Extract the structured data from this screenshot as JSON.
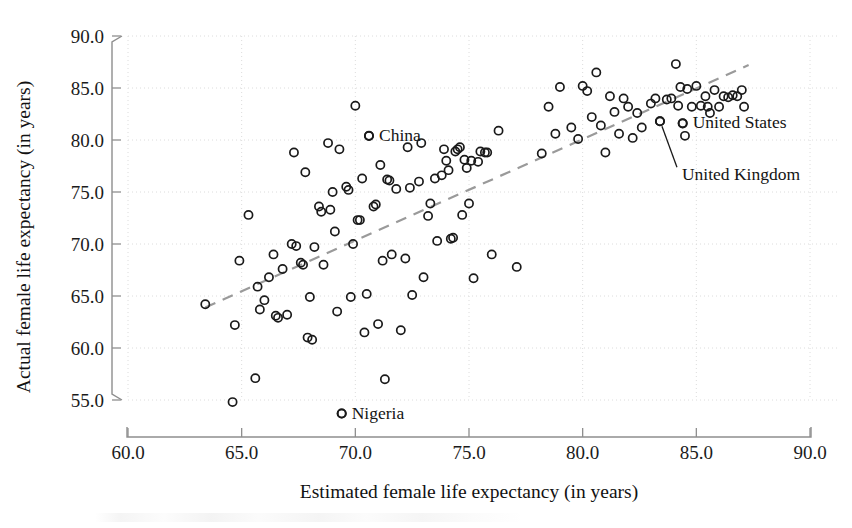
{
  "chart_data": {
    "type": "scatter",
    "title": "",
    "xlabel": "Estimated female life expectancy (in years)",
    "ylabel": "Actual female life expectancy (in years)",
    "xlim": [
      60.0,
      90.0
    ],
    "ylim": [
      55.0,
      90.0
    ],
    "xticks": [
      "60.0",
      "65.0",
      "70.0",
      "75.0",
      "80.0",
      "85.0",
      "90.0"
    ],
    "yticks": [
      "55.0",
      "60.0",
      "65.0",
      "70.0",
      "75.0",
      "80.0",
      "85.0",
      "90.0"
    ],
    "grid": true,
    "grid_style": "dotted",
    "legend": "none",
    "marker": "open-circle",
    "marker_color": "#1a1a1a",
    "trendline": {
      "style": "dashed",
      "color": "#9a9a9a",
      "x_start": 63.4,
      "y_start": 63.9,
      "x_end": 87.3,
      "y_end": 87.2
    },
    "annotations": [
      {
        "label": "China",
        "x": 70.6,
        "y": 80.4,
        "text_dx": 10,
        "text_dy": 5,
        "leader": false
      },
      {
        "label": "Nigeria",
        "x": 69.4,
        "y": 53.7,
        "text_dx": 10,
        "text_dy": 5,
        "leader": false
      },
      {
        "label": "United States",
        "x": 84.4,
        "y": 81.6,
        "text_dx": 10,
        "text_dy": 5,
        "leader": false
      },
      {
        "label": "United Kingdom",
        "x": 83.4,
        "y": 81.8,
        "text_dx": 10,
        "text_dy": 5,
        "leader": true
      }
    ],
    "points": [
      [
        63.4,
        64.2
      ],
      [
        64.6,
        54.8
      ],
      [
        64.7,
        62.2
      ],
      [
        64.9,
        68.4
      ],
      [
        65.3,
        72.8
      ],
      [
        65.6,
        57.1
      ],
      [
        65.7,
        65.9
      ],
      [
        65.8,
        63.7
      ],
      [
        66.0,
        64.6
      ],
      [
        66.2,
        66.8
      ],
      [
        66.4,
        69.0
      ],
      [
        66.5,
        63.1
      ],
      [
        66.6,
        62.9
      ],
      [
        66.8,
        67.6
      ],
      [
        67.0,
        63.2
      ],
      [
        67.2,
        70.0
      ],
      [
        67.3,
        78.8
      ],
      [
        67.4,
        69.8
      ],
      [
        67.6,
        68.2
      ],
      [
        67.7,
        68.0
      ],
      [
        67.8,
        76.9
      ],
      [
        67.9,
        61.0
      ],
      [
        68.0,
        64.9
      ],
      [
        68.1,
        60.8
      ],
      [
        68.2,
        69.7
      ],
      [
        68.4,
        73.6
      ],
      [
        68.5,
        73.1
      ],
      [
        68.6,
        68.0
      ],
      [
        68.8,
        79.7
      ],
      [
        68.9,
        73.3
      ],
      [
        69.0,
        75.0
      ],
      [
        69.1,
        71.2
      ],
      [
        69.2,
        63.5
      ],
      [
        69.3,
        79.1
      ],
      [
        69.4,
        53.7
      ],
      [
        69.6,
        75.5
      ],
      [
        69.7,
        75.2
      ],
      [
        69.8,
        64.9
      ],
      [
        69.9,
        70.0
      ],
      [
        70.0,
        83.3
      ],
      [
        70.1,
        72.3
      ],
      [
        70.2,
        72.3
      ],
      [
        70.3,
        76.3
      ],
      [
        70.4,
        61.5
      ],
      [
        70.5,
        65.2
      ],
      [
        70.6,
        80.4
      ],
      [
        70.8,
        73.6
      ],
      [
        70.9,
        73.8
      ],
      [
        71.0,
        62.3
      ],
      [
        71.1,
        77.6
      ],
      [
        71.2,
        68.4
      ],
      [
        71.3,
        57.0
      ],
      [
        71.4,
        76.2
      ],
      [
        71.5,
        76.1
      ],
      [
        71.6,
        69.0
      ],
      [
        71.8,
        75.3
      ],
      [
        72.0,
        61.7
      ],
      [
        72.2,
        68.6
      ],
      [
        72.3,
        79.3
      ],
      [
        72.4,
        75.4
      ],
      [
        72.5,
        65.1
      ],
      [
        72.8,
        76.0
      ],
      [
        72.9,
        79.7
      ],
      [
        73.0,
        66.8
      ],
      [
        73.2,
        72.7
      ],
      [
        73.3,
        73.9
      ],
      [
        73.5,
        76.3
      ],
      [
        73.6,
        70.3
      ],
      [
        73.8,
        76.6
      ],
      [
        73.9,
        79.1
      ],
      [
        74.0,
        78.0
      ],
      [
        74.1,
        77.1
      ],
      [
        74.2,
        70.5
      ],
      [
        74.3,
        70.6
      ],
      [
        74.4,
        78.9
      ],
      [
        74.5,
        79.1
      ],
      [
        74.6,
        79.3
      ],
      [
        74.7,
        72.8
      ],
      [
        74.8,
        78.1
      ],
      [
        74.9,
        77.3
      ],
      [
        75.0,
        73.9
      ],
      [
        75.1,
        78.0
      ],
      [
        75.2,
        66.7
      ],
      [
        75.4,
        77.9
      ],
      [
        75.5,
        78.9
      ],
      [
        75.7,
        78.8
      ],
      [
        75.8,
        78.8
      ],
      [
        76.0,
        69.0
      ],
      [
        76.3,
        80.9
      ],
      [
        77.1,
        67.8
      ],
      [
        78.2,
        78.7
      ],
      [
        78.5,
        83.2
      ],
      [
        78.8,
        80.6
      ],
      [
        79.0,
        85.1
      ],
      [
        79.5,
        81.2
      ],
      [
        79.8,
        80.1
      ],
      [
        80.0,
        85.2
      ],
      [
        80.2,
        84.7
      ],
      [
        80.4,
        82.2
      ],
      [
        80.6,
        86.5
      ],
      [
        80.8,
        81.4
      ],
      [
        81.0,
        78.8
      ],
      [
        81.2,
        84.2
      ],
      [
        81.4,
        82.7
      ],
      [
        81.6,
        80.6
      ],
      [
        81.8,
        84.0
      ],
      [
        82.0,
        83.2
      ],
      [
        82.2,
        80.2
      ],
      [
        82.4,
        82.6
      ],
      [
        82.6,
        81.2
      ],
      [
        83.0,
        83.5
      ],
      [
        83.2,
        84.0
      ],
      [
        83.4,
        81.8
      ],
      [
        83.7,
        83.9
      ],
      [
        83.9,
        84.0
      ],
      [
        84.1,
        87.3
      ],
      [
        84.2,
        83.3
      ],
      [
        84.3,
        85.1
      ],
      [
        84.4,
        81.6
      ],
      [
        84.5,
        80.4
      ],
      [
        84.6,
        84.9
      ],
      [
        84.8,
        83.2
      ],
      [
        85.0,
        85.2
      ],
      [
        85.2,
        83.3
      ],
      [
        85.4,
        84.2
      ],
      [
        85.5,
        83.2
      ],
      [
        85.6,
        82.6
      ],
      [
        85.8,
        84.8
      ],
      [
        86.0,
        83.2
      ],
      [
        86.2,
        84.2
      ],
      [
        86.4,
        84.1
      ],
      [
        86.6,
        84.3
      ],
      [
        86.8,
        84.2
      ],
      [
        87.0,
        84.8
      ],
      [
        87.1,
        83.2
      ]
    ]
  }
}
